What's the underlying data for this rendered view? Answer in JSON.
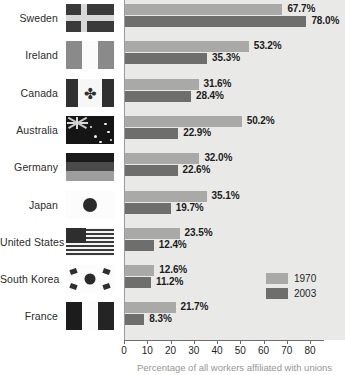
{
  "chart_data": {
    "type": "bar",
    "orientation": "horizontal",
    "title": "",
    "xlabel": "Percentage of all workers affiliated with unions",
    "ylabel": "",
    "xlim": [
      0,
      80
    ],
    "xticks": [
      0,
      10,
      20,
      30,
      40,
      50,
      60,
      70,
      80
    ],
    "grid": false,
    "legend_position": "right-inner",
    "categories": [
      "Sweden",
      "Ireland",
      "Canada",
      "Australia",
      "Germany",
      "Japan",
      "United States",
      "South Korea",
      "France"
    ],
    "series": [
      {
        "name": "1970",
        "color": "#a9a9a7",
        "values": [
          67.7,
          53.2,
          31.6,
          50.2,
          32.0,
          35.1,
          23.5,
          12.6,
          21.7
        ],
        "labels": [
          "67.7%",
          "53.2%",
          "31.6%",
          "50.2%",
          "32.0%",
          "35.1%",
          "23.5%",
          "12.6%",
          "21.7%"
        ]
      },
      {
        "name": "2003",
        "color": "#6e6e6c",
        "values": [
          78.0,
          35.3,
          28.4,
          22.9,
          22.6,
          19.7,
          12.4,
          11.2,
          8.3
        ],
        "labels": [
          "78.0%",
          "35.3%",
          "28.4%",
          "22.9%",
          "22.6%",
          "19.7%",
          "12.4%",
          "11.2%",
          "8.3%"
        ]
      }
    ]
  },
  "axis": {
    "tick_labels": [
      "0",
      "10",
      "20",
      "30",
      "40",
      "50",
      "60",
      "70",
      "80"
    ],
    "caption": "Percentage of all workers affiliated with unions"
  },
  "legend": {
    "items": [
      {
        "label": "1970",
        "swatch": "legend-swatch-1970"
      },
      {
        "label": "2003",
        "swatch": "legend-swatch-2003"
      }
    ]
  },
  "rows": [
    {
      "country": "Sweden",
      "flag_icon": "flag-sweden-icon",
      "v1970": "67.7%",
      "v2003": "78.0%"
    },
    {
      "country": "Ireland",
      "flag_icon": "flag-ireland-icon",
      "v1970": "53.2%",
      "v2003": "35.3%"
    },
    {
      "country": "Canada",
      "flag_icon": "flag-canada-icon",
      "v1970": "31.6%",
      "v2003": "28.4%"
    },
    {
      "country": "Australia",
      "flag_icon": "flag-australia-icon",
      "v1970": "50.2%",
      "v2003": "22.9%"
    },
    {
      "country": "Germany",
      "flag_icon": "flag-germany-icon",
      "v1970": "32.0%",
      "v2003": "22.6%"
    },
    {
      "country": "Japan",
      "flag_icon": "flag-japan-icon",
      "v1970": "35.1%",
      "v2003": "19.7%"
    },
    {
      "country": "United States",
      "flag_icon": "flag-united-states-icon",
      "v1970": "23.5%",
      "v2003": "12.4%"
    },
    {
      "country": "South Korea",
      "flag_icon": "flag-south-korea-icon",
      "v1970": "12.6%",
      "v2003": "11.2%"
    },
    {
      "country": "France",
      "flag_icon": "flag-france-icon",
      "v1970": "21.7%",
      "v2003": "8.3%"
    }
  ],
  "colors": {
    "series_1970": "#a9a9a7",
    "series_2003": "#6e6e6c",
    "plot_background": "#e9e9e7",
    "axis": "#6d6d6d",
    "text": "#1c1c1c"
  },
  "maple_leaf_glyph": "✤"
}
